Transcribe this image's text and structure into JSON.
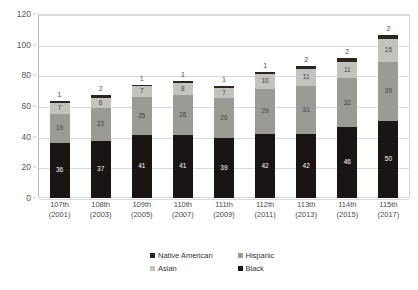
{
  "chart_data": {
    "type": "bar",
    "subtype": "stacked-bar",
    "title": "",
    "xlabel": "",
    "ylabel": "",
    "ylim": [
      0,
      120
    ],
    "ytick_labels": [
      "0",
      "20",
      "40",
      "60",
      "80",
      "100",
      "120"
    ],
    "yticks": [
      0,
      20,
      40,
      60,
      80,
      100,
      120
    ],
    "grid": true,
    "legend_position": "bottom",
    "categories": [
      "107th\n(2001)",
      "108th\n(2003)",
      "109th\n(2005)",
      "110th\n(2007)",
      "111th\n(2009)",
      "112th\n(2011)",
      "113th\n(2013)",
      "114th\n(2015)",
      "115th\n(2017)"
    ],
    "category_lines": [
      {
        "congress": "107th",
        "year": "(2001)"
      },
      {
        "congress": "108th",
        "year": "(2003)"
      },
      {
        "congress": "109th",
        "year": "(2005)"
      },
      {
        "congress": "110th",
        "year": "(2007)"
      },
      {
        "congress": "111th",
        "year": "(2009)"
      },
      {
        "congress": "112th",
        "year": "(2011)"
      },
      {
        "congress": "113th",
        "year": "(2013)"
      },
      {
        "congress": "114th",
        "year": "(2015)"
      },
      {
        "congress": "115th",
        "year": "(2017)"
      }
    ],
    "stack_order_bottom_to_top": [
      "Black",
      "Hispanic",
      "Asian",
      "Native American"
    ],
    "series": [
      {
        "name": "Black",
        "color": "#1a1512",
        "values": [
          36,
          37,
          41,
          41,
          39,
          42,
          42,
          46,
          50
        ]
      },
      {
        "name": "Hispanic",
        "color": "#9b9b96",
        "values": [
          19,
          22,
          25,
          26,
          26,
          29,
          31,
          32,
          39
        ]
      },
      {
        "name": "Asian",
        "color": "#c3c3bd",
        "values": [
          7,
          6,
          7,
          8,
          7,
          10,
          11,
          11,
          15
        ]
      },
      {
        "name": "Native American",
        "color": "#2b2520",
        "values": [
          1,
          2,
          1,
          1,
          1,
          1,
          2,
          2,
          2
        ]
      }
    ],
    "totals": [
      63,
      67,
      74,
      76,
      73,
      82,
      86,
      91,
      106
    ],
    "legend_entries": [
      {
        "label": "Native American",
        "color": "#2b2520"
      },
      {
        "label": "Hispanic",
        "color": "#9b9b96"
      },
      {
        "label": "Asian",
        "color": "#c3c3bd"
      },
      {
        "label": "Black",
        "color": "#1a1512"
      }
    ]
  }
}
